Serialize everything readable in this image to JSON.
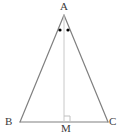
{
  "figure": {
    "kind": "isosceles-triangle-with-median",
    "title": "",
    "background_color": "#ffffff",
    "stroke_color": "#808080",
    "median_color": "#c8c8c8",
    "mark_color": "#000000",
    "label_color": "#3a3a3a",
    "stroke_width": 1.2,
    "median_stroke_width": 1
  },
  "labels": {
    "apex": "A",
    "base_left": "B",
    "base_right": "C",
    "foot": "M"
  },
  "points": {
    "A": {
      "x": 64,
      "y": 15
    },
    "B": {
      "x": 20,
      "y": 122
    },
    "C": {
      "x": 108,
      "y": 122
    },
    "M": {
      "x": 64,
      "y": 122
    }
  },
  "segments": [
    {
      "name": "AB",
      "from": "A",
      "to": "B",
      "style": "solid"
    },
    {
      "name": "AC",
      "from": "A",
      "to": "C",
      "style": "solid"
    },
    {
      "name": "BC",
      "from": "B",
      "to": "C",
      "style": "solid"
    },
    {
      "name": "AM",
      "from": "A",
      "to": "M",
      "style": "light"
    }
  ],
  "angle_marks": {
    "type": "equal-angle-dots",
    "count": 2,
    "at_vertex": "A",
    "dots": [
      {
        "x": 60,
        "y": 30,
        "r": 1.6
      },
      {
        "x": 68,
        "y": 30,
        "r": 1.6
      }
    ]
  },
  "right_angle_mark": {
    "at_vertex": "M",
    "size": 6,
    "opens_toward": "C"
  }
}
